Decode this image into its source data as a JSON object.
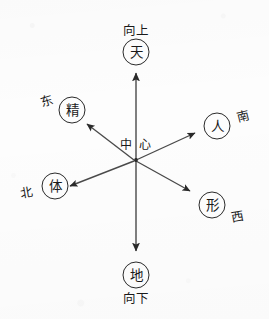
{
  "diagram": {
    "center": {
      "label": "中 心",
      "x": 136,
      "y": 160
    },
    "stroke_color": "#2a2a2a",
    "background_color": "#fdfdfd",
    "nodes": [
      {
        "id": "tian",
        "char": "天",
        "direction_label": "向上",
        "circle_x": 136,
        "circle_y": 52,
        "label_x": 136,
        "label_y": 31,
        "arrow_tip_x": 136,
        "arrow_tip_y": 72
      },
      {
        "id": "di",
        "char": "地",
        "direction_label": "向下",
        "circle_x": 136,
        "circle_y": 275,
        "label_x": 136,
        "label_y": 299,
        "arrow_tip_x": 136,
        "arrow_tip_y": 252
      },
      {
        "id": "jing",
        "char": "精",
        "direction_label": "东",
        "circle_x": 72,
        "circle_y": 110,
        "label_x": 47,
        "label_y": 101,
        "arrow_tip_x": 86,
        "arrow_tip_y": 123
      },
      {
        "id": "ren",
        "char": "人",
        "direction_label": "南",
        "circle_x": 217,
        "circle_y": 126,
        "label_x": 243,
        "label_y": 117,
        "arrow_tip_x": 196,
        "arrow_tip_y": 132
      },
      {
        "id": "ti",
        "char": "体",
        "direction_label": "北",
        "circle_x": 55,
        "circle_y": 186,
        "label_x": 27,
        "label_y": 193,
        "arrow_tip_x": 69,
        "arrow_tip_y": 186
      },
      {
        "id": "xing",
        "char": "形",
        "direction_label": "西",
        "circle_x": 212,
        "circle_y": 205,
        "label_x": 238,
        "label_y": 217,
        "arrow_tip_x": 191,
        "arrow_tip_y": 192
      }
    ],
    "axes": [
      {
        "id": "vertical-axis",
        "from": "地",
        "to": "天"
      },
      {
        "id": "ne-sw-axis",
        "from": "体",
        "to": "人"
      },
      {
        "id": "nw-se-axis",
        "from": "形",
        "to": "精"
      }
    ]
  }
}
